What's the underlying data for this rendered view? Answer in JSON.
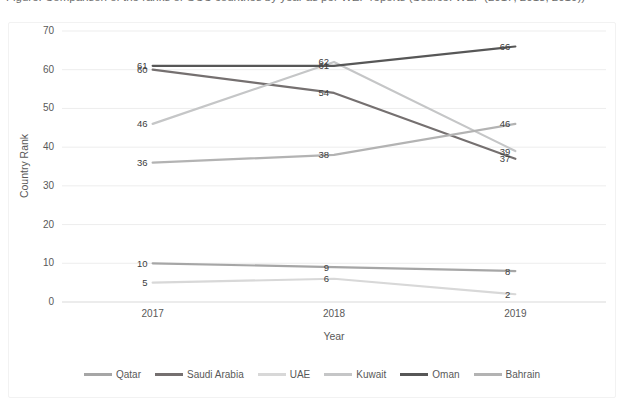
{
  "clipped_title": "Figure: Comparison of the ranks of GCC countries by year as per WEF reports (Source: WEF (2017, 2018, 2019))",
  "chart_data": {
    "type": "line",
    "categories": [
      "2017",
      "2018",
      "2019"
    ],
    "series": [
      {
        "name": "Qatar",
        "color": "#a6a6a6",
        "values": [
          10,
          9,
          8
        ]
      },
      {
        "name": "Saudi Arabia",
        "color": "#757070",
        "values": [
          60,
          54,
          37
        ]
      },
      {
        "name": "UAE",
        "color": "#d8d8d8",
        "values": [
          5,
          6,
          2
        ]
      },
      {
        "name": "Kuwait",
        "color": "#c5c6c7",
        "values": [
          46,
          62,
          39
        ]
      },
      {
        "name": "Oman",
        "color": "#575757",
        "values": [
          61,
          61,
          66
        ]
      },
      {
        "name": "Bahrain",
        "color": "#b3b3b3",
        "values": [
          36,
          38,
          46
        ]
      }
    ],
    "xlabel": "Year",
    "ylabel": "Country Rank",
    "ylim": [
      0,
      70
    ],
    "yticks": [
      0,
      10,
      20,
      30,
      40,
      50,
      60,
      70
    ],
    "grid": true,
    "data_labels": true,
    "legend_position": "bottom",
    "gridline_color": "#ededed",
    "baseline_color": "#d9d9d9",
    "data_label_color": "#404040",
    "axis_text_color": "#595959"
  }
}
